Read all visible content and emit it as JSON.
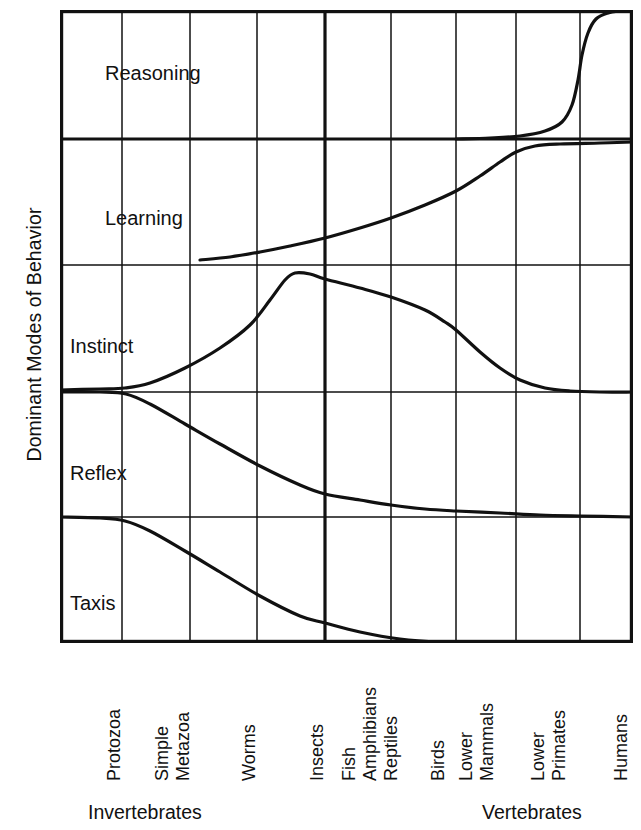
{
  "axes": {
    "y_title": "Dominant Modes of Behavior"
  },
  "groups": [
    {
      "label": "Invertebrates",
      "left": 88,
      "top": 801
    },
    {
      "label": "Vertebrates",
      "left": 482,
      "top": 801
    }
  ],
  "chart_data": {
    "type": "area",
    "title": "",
    "xlabel": "",
    "ylabel": "Dominant Modes of Behavior",
    "grid": true,
    "legend_position": "none",
    "categories": [
      "Protozoa",
      "Simple Metazoa",
      "Worms",
      "Insects",
      "Fish",
      "Amphibians",
      "Reptiles",
      "Birds",
      "Lower Mammals",
      "Lower Primates",
      "Humans"
    ],
    "category_groups": [
      {
        "name": "Invertebrates",
        "members": [
          "Protozoa",
          "Simple Metazoa",
          "Worms",
          "Insects"
        ]
      },
      {
        "name": "Vertebrates",
        "members": [
          "Fish",
          "Amphibians",
          "Reptiles",
          "Birds",
          "Lower Mammals",
          "Lower Primates",
          "Humans"
        ]
      }
    ],
    "bands": [
      {
        "name": "Reasoning",
        "label_x": 105,
        "label_y": 62
      },
      {
        "name": "Learning",
        "label_x": 105,
        "label_y": 207
      },
      {
        "name": "Instinct",
        "label_x": 70,
        "label_y": 335
      },
      {
        "name": "Reflex",
        "label_x": 70,
        "label_y": 462
      },
      {
        "name": "Taxis",
        "label_x": 70,
        "label_y": 592
      }
    ],
    "band_dividers_y": [
      139,
      265,
      392,
      517
    ],
    "grid_x": [
      122,
      190,
      257,
      325,
      391,
      456,
      516,
      580
    ],
    "major_divider_x": 325,
    "series": [
      {
        "name": "Taxis",
        "note": "Upper boundary of Taxis band; high (near Reflex divider) for Protozoa, declines sharply through Worms and Insects, reaching zero by Fish/Amphibians.",
        "points": [
          [
            60,
            517
          ],
          [
            100,
            518
          ],
          [
            125,
            521
          ],
          [
            150,
            531
          ],
          [
            185,
            551
          ],
          [
            220,
            572
          ],
          [
            260,
            596
          ],
          [
            300,
            616
          ],
          [
            325,
            623
          ],
          [
            360,
            632
          ],
          [
            400,
            639
          ],
          [
            440,
            642
          ],
          [
            500,
            643
          ],
          [
            633,
            643
          ]
        ]
      },
      {
        "name": "Reflex",
        "note": "Upper boundary of Reflex band; high for Protozoa/Simple Metazoa then steadily declines toward Humans.",
        "points": [
          [
            60,
            392
          ],
          [
            100,
            392
          ],
          [
            126,
            394
          ],
          [
            150,
            404
          ],
          [
            185,
            424
          ],
          [
            220,
            444
          ],
          [
            260,
            466
          ],
          [
            300,
            485
          ],
          [
            325,
            494
          ],
          [
            360,
            500
          ],
          [
            391,
            505
          ],
          [
            425,
            509
          ],
          [
            456,
            511
          ],
          [
            500,
            513
          ],
          [
            540,
            515
          ],
          [
            580,
            516
          ],
          [
            633,
            517
          ]
        ]
      },
      {
        "name": "Instinct",
        "note": "Upper boundary of Instinct band; rises from Simple Metazoa, peaks at Insects, then declines steeply through Lower Mammals to near zero for Primates and Humans.",
        "points": [
          [
            60,
            390
          ],
          [
            100,
            389
          ],
          [
            125,
            388
          ],
          [
            150,
            383
          ],
          [
            185,
            368
          ],
          [
            220,
            348
          ],
          [
            250,
            325
          ],
          [
            270,
            300
          ],
          [
            285,
            280
          ],
          [
            295,
            273
          ],
          [
            310,
            274
          ],
          [
            325,
            279
          ],
          [
            360,
            288
          ],
          [
            391,
            297
          ],
          [
            425,
            310
          ],
          [
            445,
            322
          ],
          [
            456,
            330
          ],
          [
            480,
            352
          ],
          [
            500,
            368
          ],
          [
            520,
            380
          ],
          [
            545,
            388
          ],
          [
            570,
            391
          ],
          [
            600,
            392
          ],
          [
            633,
            392
          ]
        ]
      },
      {
        "name": "Learning",
        "note": "Upper boundary of Learning band; begins around Worms, grows steadily through the vertebrates and saturates at Lower Primates.",
        "points": [
          [
            200,
            260
          ],
          [
            230,
            257
          ],
          [
            260,
            252
          ],
          [
            290,
            246
          ],
          [
            325,
            238
          ],
          [
            360,
            228
          ],
          [
            391,
            218
          ],
          [
            425,
            205
          ],
          [
            456,
            191
          ],
          [
            480,
            176
          ],
          [
            500,
            162
          ],
          [
            516,
            152
          ],
          [
            535,
            146
          ],
          [
            560,
            144
          ],
          [
            600,
            143
          ],
          [
            633,
            142
          ]
        ]
      },
      {
        "name": "Reasoning",
        "note": "Upper boundary of Reasoning band; essentially nil until Lower Mammals, rises steeply at Lower Primates and saturates at Humans.",
        "points": [
          [
            456,
            139
          ],
          [
            490,
            138
          ],
          [
            520,
            136
          ],
          [
            545,
            131
          ],
          [
            562,
            122
          ],
          [
            572,
            105
          ],
          [
            578,
            80
          ],
          [
            582,
            55
          ],
          [
            588,
            33
          ],
          [
            596,
            19
          ],
          [
            608,
            13
          ],
          [
            620,
            11
          ],
          [
            633,
            10
          ]
        ]
      }
    ]
  },
  "tick_labels": [
    {
      "name": "Protozoa",
      "lines": [
        "Protozoa"
      ],
      "x": 104,
      "y": 781
    },
    {
      "name": "Simple Metazoa",
      "lines": [
        "Simple",
        "Metazoa"
      ],
      "x": 152,
      "y": 781
    },
    {
      "name": "Worms",
      "lines": [
        "Worms"
      ],
      "x": 239,
      "y": 781
    },
    {
      "name": "Insects",
      "lines": [
        "Insects"
      ],
      "x": 307,
      "y": 781
    },
    {
      "name": "Fish",
      "lines": [
        "Fish"
      ],
      "x": 339,
      "y": 781
    },
    {
      "name": "Amphibians",
      "lines": [
        "Amphibians"
      ],
      "x": 360,
      "y": 781
    },
    {
      "name": "Reptiles",
      "lines": [
        "Reptiles"
      ],
      "x": 381,
      "y": 781
    },
    {
      "name": "Birds",
      "lines": [
        "Birds"
      ],
      "x": 428,
      "y": 781
    },
    {
      "name": "Lower Mammals",
      "lines": [
        "Lower",
        "Mammals"
      ],
      "x": 456,
      "y": 781
    },
    {
      "name": "Lower Primates",
      "lines": [
        "Lower",
        "Primates"
      ],
      "x": 528,
      "y": 781
    },
    {
      "name": "Humans",
      "lines": [
        "Humans"
      ],
      "x": 611,
      "y": 781
    }
  ]
}
